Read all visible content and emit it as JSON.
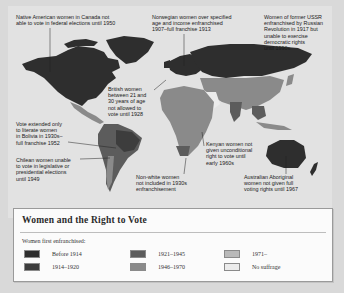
{
  "map": {
    "annotations": [
      {
        "id": "canada",
        "text": "Native American women in Canada not\nable to vote in federal elections until 1950"
      },
      {
        "id": "norway",
        "text": "Norwegian women over specified\nage and income enfranchised\n1907–full franchise 1913"
      },
      {
        "id": "ussr",
        "text": "Women of former USSR\nenfranchised by Russian\nRevolution in 1917 but\nunable to exercise\ndemocratic rights\nuntil 1990s"
      },
      {
        "id": "britain",
        "text": "British women\nbetween 21 and\n30 years of age\nnot allowed to\nvote until 1928"
      },
      {
        "id": "bolivia",
        "text": "Vote extended only\nto literate women\nin Bolivia in 1930s–\nfull franchise 1952"
      },
      {
        "id": "kenya",
        "text": "Kenyan women not\ngiven unconditional\nright to vote until\nearly 1960s"
      },
      {
        "id": "chile",
        "text": "Chilean women unable\nto vote in legislative or\npresidential elections\nuntil 1949"
      },
      {
        "id": "south-africa",
        "text": "Non-white women\nnot included in 1930s\nenfranchisement"
      },
      {
        "id": "australia",
        "text": "Australian Aboriginal\nwomen not given full\nvoting rights until 1967"
      }
    ]
  },
  "legend": {
    "title": "Women and the Right to Vote",
    "subtitle": "Women first enfranchised:",
    "items": [
      {
        "label": "Before 1914",
        "color": "#2e2e2e"
      },
      {
        "label": "1914–1920",
        "color": "#3d3d3d"
      },
      {
        "label": "1921–1945",
        "color": "#5c5c5c"
      },
      {
        "label": "1946–1970",
        "color": "#8a8a8a"
      },
      {
        "label": "1971–",
        "color": "#b9b9b9"
      },
      {
        "label": "No suffrage",
        "color": "#ebebeb"
      }
    ]
  },
  "colors": {
    "ocean": "#e2e2e2",
    "page": "#d9d9d9",
    "leader_line": "#222222"
  }
}
